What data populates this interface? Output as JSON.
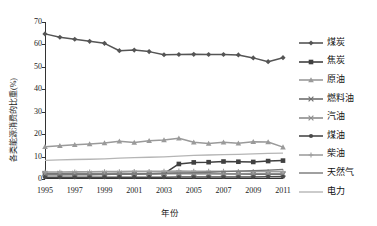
{
  "chart_data": {
    "type": "line",
    "title": "",
    "xlabel": "年份",
    "ylabel": "各类能源消费的比重(%)",
    "xlim": [
      1995,
      2011
    ],
    "ylim": [
      0,
      70
    ],
    "ytick_labels": [
      "0",
      "10",
      "20",
      "30",
      "40",
      "50",
      "60",
      "70"
    ],
    "ytick_values": [
      0,
      10,
      20,
      30,
      40,
      50,
      60,
      70
    ],
    "xtick_labels": [
      "1995",
      "1997",
      "1999",
      "2001",
      "2003",
      "2005",
      "2007",
      "2009",
      "2011"
    ],
    "xtick_values": [
      1995,
      1997,
      1999,
      2001,
      2003,
      2005,
      2007,
      2009,
      2011
    ],
    "x": [
      1995,
      1996,
      1997,
      1998,
      1999,
      2000,
      2001,
      2002,
      2003,
      2004,
      2005,
      2006,
      2007,
      2008,
      2009,
      2010,
      2011
    ],
    "grid": false,
    "legend_position": "right",
    "series": [
      {
        "name": "煤炭",
        "color": "#555555",
        "marker": "diamond",
        "values": [
          64.7,
          63.2,
          62.3,
          61.4,
          60.5,
          57.2,
          57.5,
          56.8,
          55.4,
          55.5,
          55.6,
          55.5,
          55.5,
          55.3,
          54.0,
          52.3,
          54.1
        ]
      },
      {
        "name": "焦炭",
        "color": "#404040",
        "marker": "square",
        "values": [
          2.2,
          2.2,
          2.2,
          2.1,
          2.1,
          2.1,
          2.2,
          2.3,
          2.4,
          6.7,
          7.4,
          7.5,
          7.8,
          7.7,
          7.6,
          8.0,
          8.2
        ]
      },
      {
        "name": "原油",
        "color": "#9a9a9a",
        "marker": "triangle",
        "values": [
          14.4,
          14.8,
          15.3,
          15.6,
          16.0,
          16.8,
          16.3,
          17.0,
          17.4,
          18.2,
          16.4,
          15.8,
          16.4,
          15.9,
          16.6,
          16.5,
          14.2
        ]
      },
      {
        "name": "燃料油",
        "color": "#6f6f6f",
        "marker": "cross",
        "values": [
          2.5,
          2.5,
          2.6,
          2.5,
          2.5,
          2.6,
          2.5,
          2.5,
          2.6,
          2.7,
          2.5,
          2.4,
          2.3,
          2.2,
          2.1,
          2.1,
          2.0
        ]
      },
      {
        "name": "汽油",
        "color": "#8c8c8c",
        "marker": "cross",
        "values": [
          2.0,
          2.0,
          2.1,
          2.1,
          2.2,
          2.2,
          2.2,
          2.3,
          2.3,
          2.4,
          2.3,
          2.3,
          2.3,
          2.3,
          2.4,
          2.4,
          2.4
        ]
      },
      {
        "name": "煤油",
        "color": "#4a4a4a",
        "marker": "circle",
        "values": [
          0.8,
          0.8,
          0.8,
          0.8,
          0.8,
          0.8,
          0.8,
          0.8,
          0.8,
          0.9,
          0.9,
          0.9,
          0.9,
          0.9,
          0.9,
          1.0,
          1.0
        ]
      },
      {
        "name": "柴油",
        "color": "#9f9f9f",
        "marker": "plus",
        "values": [
          3.1,
          3.1,
          3.2,
          3.2,
          3.3,
          3.3,
          3.4,
          3.4,
          3.5,
          3.6,
          3.5,
          3.5,
          3.5,
          3.4,
          3.4,
          3.4,
          3.3
        ]
      },
      {
        "name": "天然气",
        "color": "#777777",
        "marker": "none",
        "values": [
          1.8,
          1.8,
          1.9,
          1.9,
          2.0,
          2.2,
          2.3,
          2.4,
          2.5,
          2.6,
          2.8,
          3.0,
          3.3,
          3.5,
          3.7,
          4.0,
          4.3
        ]
      },
      {
        "name": "电力",
        "color": "#b5b5b5",
        "marker": "none",
        "values": [
          8.3,
          8.5,
          8.7,
          8.8,
          9.0,
          9.3,
          9.5,
          9.7,
          9.9,
          10.2,
          10.5,
          10.7,
          10.9,
          11.0,
          11.2,
          11.4,
          11.5
        ]
      }
    ]
  },
  "legend": {
    "items": [
      {
        "label": "煤炭"
      },
      {
        "label": "焦炭"
      },
      {
        "label": "原油"
      },
      {
        "label": "燃料油"
      },
      {
        "label": "汽油"
      },
      {
        "label": "煤油"
      },
      {
        "label": "柴油"
      },
      {
        "label": "天然气"
      },
      {
        "label": "电力"
      }
    ]
  }
}
